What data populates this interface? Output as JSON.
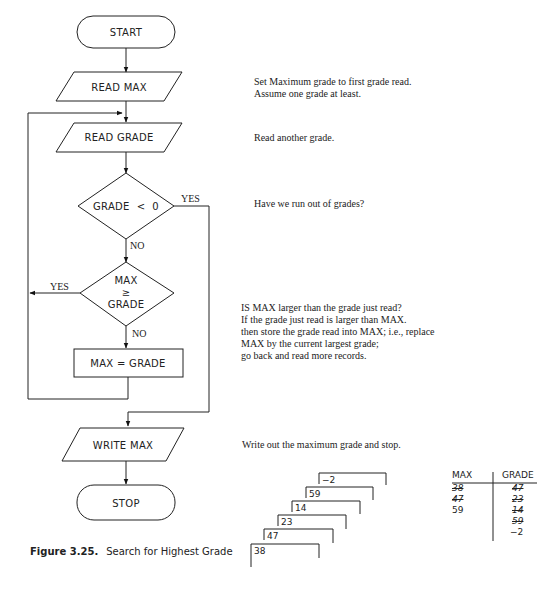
{
  "flowchart": {
    "nodes": {
      "start": "START",
      "read_max": "READ MAX",
      "read_grade": "READ GRADE",
      "decision1": "GRADE  <  0",
      "decision2_line1": "MAX",
      "decision2_line2": "≥",
      "decision2_line3": "GRADE",
      "assign": "MAX = GRADE",
      "write_max": "WRITE MAX",
      "stop": "STOP"
    },
    "edge_labels": {
      "d1_yes": "YES",
      "d1_no": "NO",
      "d2_yes": "YES",
      "d2_no": "NO"
    }
  },
  "notes": {
    "read_max_1": "Set Maximum grade to first grade read.",
    "read_max_2": "Assume one grade at least.",
    "read_grade": "Read another grade.",
    "decision1": "Have we run out of grades?",
    "decision2_1": "IS MAX larger than the grade just read?",
    "decision2_2": "If the grade just read is larger than MAX.",
    "decision2_3": "then store the grade read into MAX; i.e., replace",
    "decision2_4": "MAX by the current largest grade;",
    "decision2_5": "go back and read more records.",
    "write_max": "Write out the maximum grade and stop."
  },
  "caption": {
    "label": "Figure 3.25.",
    "text": "Search for Highest Grade"
  },
  "cards": [
    "−2",
    "59",
    "14",
    "23",
    "47",
    "38"
  ],
  "trace_table": {
    "headers": [
      "MAX",
      "GRADE"
    ],
    "max_values": [
      "38",
      "47",
      "59"
    ],
    "max_struck": [
      true,
      true,
      false
    ],
    "grade_values": [
      "47",
      "23",
      "14",
      "59",
      "−2"
    ],
    "grade_struck": [
      true,
      true,
      true,
      true,
      false
    ]
  }
}
